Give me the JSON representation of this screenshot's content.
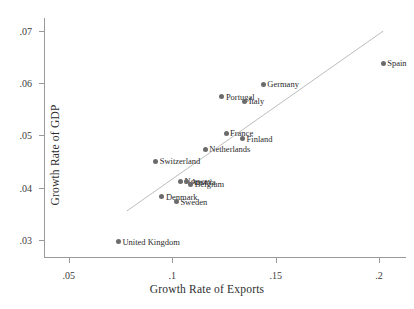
{
  "chart_data": {
    "type": "scatter",
    "title": "",
    "xlabel": "Growth Rate of Exports",
    "ylabel": "Growth Rate of GDP",
    "xlim": [
      0.038,
      0.213
    ],
    "ylim": [
      0.0265,
      0.0725
    ],
    "xticks": [
      0.05,
      0.1,
      0.15,
      0.2
    ],
    "xticklabels": [
      ".05",
      ".1",
      ".15",
      ".2"
    ],
    "yticks": [
      0.03,
      0.04,
      0.05,
      0.06,
      0.07
    ],
    "yticklabels": [
      ".03",
      ".04",
      ".05",
      ".06",
      ".07"
    ],
    "grid": false,
    "legend": null,
    "marker_color": "#6b6b6b",
    "fit_line_color": "#bdbdbd",
    "fit_line": {
      "x_start": 0.078,
      "y_start": 0.0355,
      "x_end": 0.202,
      "y_end": 0.07
    },
    "points": [
      {
        "label": "Spain",
        "x": 0.202,
        "y": 0.0638,
        "label_side": "right"
      },
      {
        "label": "Germany",
        "x": 0.144,
        "y": 0.0598,
        "label_side": "right"
      },
      {
        "label": "Portugal",
        "x": 0.124,
        "y": 0.0574,
        "label_side": "right"
      },
      {
        "label": "Italy",
        "x": 0.135,
        "y": 0.0565,
        "label_side": "right"
      },
      {
        "label": "France",
        "x": 0.126,
        "y": 0.0504,
        "label_side": "right"
      },
      {
        "label": "Finland",
        "x": 0.134,
        "y": 0.0494,
        "label_side": "right"
      },
      {
        "label": "Netherlands",
        "x": 0.116,
        "y": 0.0473,
        "label_side": "right"
      },
      {
        "label": "Switzerland",
        "x": 0.092,
        "y": 0.045,
        "label_side": "right"
      },
      {
        "label": "Norway",
        "x": 0.104,
        "y": 0.0412,
        "label_side": "right"
      },
      {
        "label": "Austria",
        "x": 0.107,
        "y": 0.0411,
        "label_side": "right"
      },
      {
        "label": "Belgium",
        "x": 0.109,
        "y": 0.0406,
        "label_side": "right"
      },
      {
        "label": "Denmark",
        "x": 0.095,
        "y": 0.0382,
        "label_side": "right"
      },
      {
        "label": "Sweden",
        "x": 0.102,
        "y": 0.0373,
        "label_side": "right"
      },
      {
        "label": "United Kingdom",
        "x": 0.074,
        "y": 0.0296,
        "label_side": "right"
      }
    ]
  }
}
